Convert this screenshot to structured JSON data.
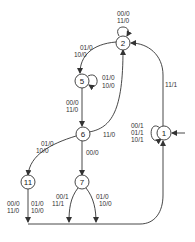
{
  "diagram": {
    "type": "finite-state-machine",
    "states": [
      {
        "id": "1",
        "label": "1",
        "initial": true
      },
      {
        "id": "2",
        "label": "2"
      },
      {
        "id": "5",
        "label": "5"
      },
      {
        "id": "6",
        "label": "6"
      },
      {
        "id": "7",
        "label": "7"
      },
      {
        "id": "11",
        "label": "11"
      }
    ],
    "transitions": [
      {
        "from": "2",
        "to": "2",
        "labels": [
          "00/0",
          "11/0"
        ]
      },
      {
        "from": "2",
        "to": "5",
        "labels": [
          "01/0",
          "10/0"
        ]
      },
      {
        "from": "5",
        "to": "5",
        "labels": [
          "01/0",
          "10/0"
        ]
      },
      {
        "from": "5",
        "to": "6",
        "labels": [
          "00/0",
          "11/0"
        ]
      },
      {
        "from": "6",
        "to": "2",
        "labels": [
          "11/0"
        ]
      },
      {
        "from": "6",
        "to": "11",
        "labels": [
          "01/0",
          "10/0"
        ]
      },
      {
        "from": "6",
        "to": "7",
        "labels": [
          "00/0"
        ]
      },
      {
        "from": "1",
        "to": "1",
        "labels": [
          "00/1",
          "01/1",
          "10/1"
        ]
      },
      {
        "from": "1",
        "to": "2",
        "labels": [
          "11/1"
        ]
      },
      {
        "from": "11",
        "to": "1",
        "labels": [
          "00/0",
          "11/0",
          "01/0",
          "10/0"
        ]
      },
      {
        "from": "7",
        "to": "1",
        "labels": [
          "00/1",
          "11/1",
          "01/0",
          "10/0"
        ]
      }
    ]
  },
  "labels": {
    "s2_loop_a": "00/0",
    "s2_loop_b": "11/0",
    "s2_s5_a": "01/0",
    "s2_s5_b": "10/0",
    "s5_loop_a": "01/0",
    "s5_loop_b": "10/0",
    "s5_s6_a": "00/0",
    "s5_s6_b": "11/0",
    "s6_s2": "11/0",
    "s6_s11_a": "01/0",
    "s6_s11_b": "10/0",
    "s6_s7": "00/0",
    "s1_loop_a": "00/1",
    "s1_loop_b": "01/1",
    "s1_loop_c": "10/1",
    "s1_s2": "11/1",
    "s11_out1_a": "00/0",
    "s11_out1_b": "11/0",
    "s11_out2_a": "01/0",
    "s11_out2_b": "10/0",
    "s7_out1_a": "00/1",
    "s7_out1_b": "11/1",
    "s7_out2_a": "01/0",
    "s7_out2_b": "10/0"
  }
}
